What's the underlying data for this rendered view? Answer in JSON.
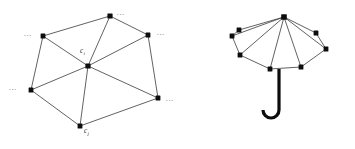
{
  "figure": {
    "background_color": "#ffffff",
    "ink_color": "#0d0d0d",
    "edge_color": "#3a3a3a",
    "label_color": "#2b2b2b",
    "ellipsis_color": "#555555",
    "panels": [
      {
        "name": "triangulated-graph",
        "labels": [
          {
            "id": "center",
            "base": "c",
            "sub": "i",
            "x": 80,
            "y": 53
          },
          {
            "id": "bottom",
            "base": "c",
            "sub": "j",
            "x": 84,
            "y": 133
          }
        ],
        "ellipses": [
          {
            "id": "top-right",
            "text": "...",
            "x": 117,
            "y": 15
          },
          {
            "id": "left-upper",
            "text": "...",
            "x": 24,
            "y": 36
          },
          {
            "id": "right-upper",
            "text": "...",
            "x": 157,
            "y": 35
          },
          {
            "id": "left-lower",
            "text": "...",
            "x": 9,
            "y": 90
          },
          {
            "id": "right-lower",
            "text": "...",
            "x": 166,
            "y": 101
          }
        ],
        "vertices": [
          {
            "id": "center",
            "x": 88,
            "y": 66,
            "r": 2.6
          },
          {
            "id": "top",
            "x": 110,
            "y": 16,
            "r": 2.6
          },
          {
            "id": "upper-left",
            "x": 43,
            "y": 36,
            "r": 2.4
          },
          {
            "id": "upper-right",
            "x": 148,
            "y": 35,
            "r": 2.4
          },
          {
            "id": "left",
            "x": 31,
            "y": 90,
            "r": 2.4
          },
          {
            "id": "right",
            "x": 158,
            "y": 98,
            "r": 2.4
          },
          {
            "id": "bottom",
            "x": 80,
            "y": 126,
            "r": 2.4
          }
        ],
        "edges": [
          {
            "from": "center",
            "to": "top"
          },
          {
            "from": "center",
            "to": "upper-left"
          },
          {
            "from": "center",
            "to": "upper-right"
          },
          {
            "from": "center",
            "to": "left"
          },
          {
            "from": "center",
            "to": "right"
          },
          {
            "from": "center",
            "to": "bottom"
          },
          {
            "from": "top",
            "to": "upper-left"
          },
          {
            "from": "top",
            "to": "upper-right"
          },
          {
            "from": "upper-left",
            "to": "left"
          },
          {
            "from": "upper-right",
            "to": "right"
          },
          {
            "from": "left",
            "to": "bottom"
          },
          {
            "from": "right",
            "to": "bottom"
          }
        ]
      },
      {
        "name": "umbrella",
        "apex": {
          "id": "apex",
          "x": 284,
          "y": 17,
          "r": 2.8
        },
        "rib_tips": [
          {
            "id": "tip-1",
            "x": 239,
            "y": 30,
            "r": 2.4
          },
          {
            "id": "tip-2",
            "x": 232,
            "y": 36,
            "r": 2.4
          },
          {
            "id": "tip-3",
            "x": 240,
            "y": 55,
            "r": 2.4
          },
          {
            "id": "tip-4",
            "x": 270,
            "y": 69,
            "r": 2.4
          },
          {
            "id": "tip-5",
            "x": 301,
            "y": 67,
            "r": 2.4
          },
          {
            "id": "tip-6",
            "x": 326,
            "y": 49,
            "r": 2.4
          },
          {
            "id": "tip-7",
            "x": 316,
            "y": 33,
            "r": 2.4
          }
        ],
        "canopy_rim": [
          "tip-1",
          "tip-2",
          "tip-3",
          "tip-4",
          "tip-5",
          "tip-6",
          "tip-7"
        ],
        "handle": {
          "pole_x": 279,
          "pole_top": 69,
          "pole_bottom": 118,
          "hook_radius": 8
        }
      }
    ]
  }
}
